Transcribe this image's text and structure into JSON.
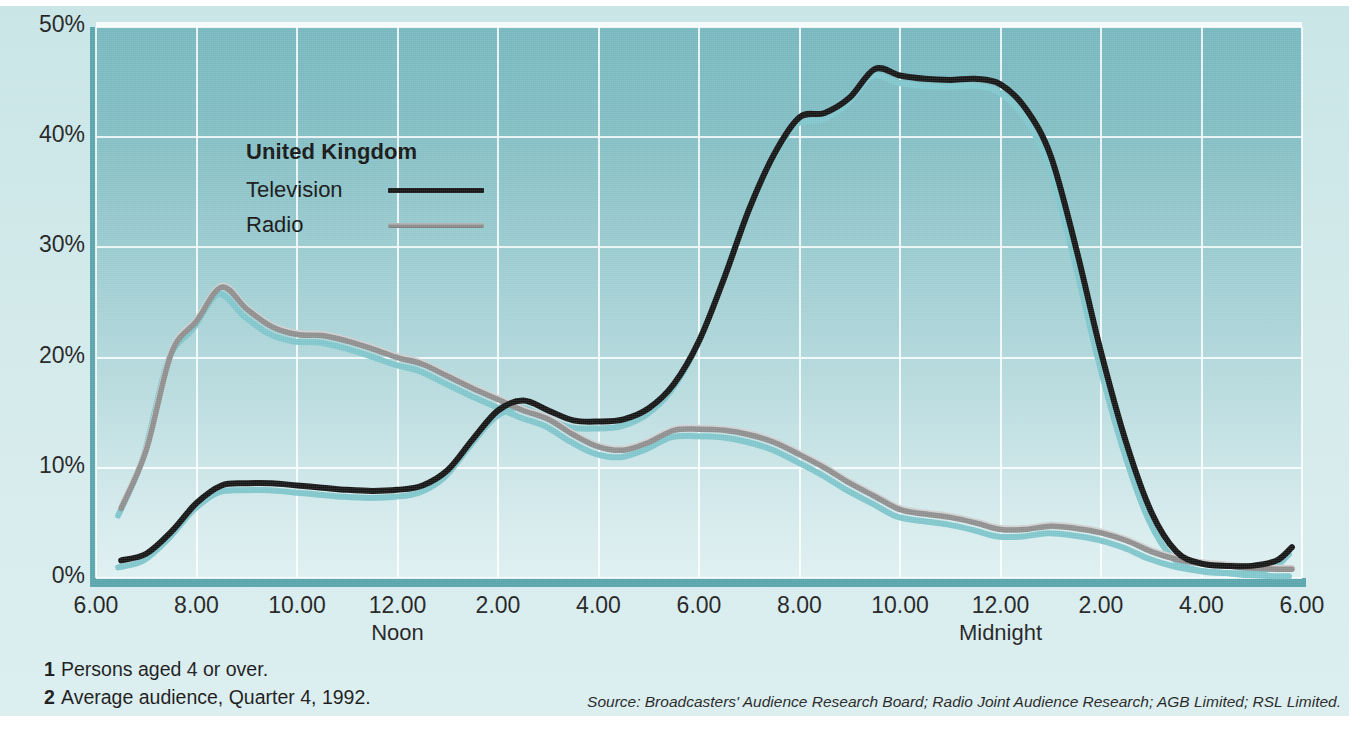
{
  "chart_data": {
    "type": "line",
    "title": "United Kingdom",
    "xlabel": "",
    "ylabel": "",
    "ylim": [
      0,
      50
    ],
    "ytick_labels": [
      "0%",
      "10%",
      "20%",
      "30%",
      "40%",
      "50%"
    ],
    "ytick_values": [
      0,
      10,
      20,
      30,
      40,
      50
    ],
    "xtick_labels": [
      "6.00",
      "8.00",
      "10.00",
      "12.00",
      "2.00",
      "4.00",
      "6.00",
      "8.00",
      "10.00",
      "12.00",
      "2.00",
      "4.00",
      "6.00"
    ],
    "xtick_sublabels": {
      "12.00_first": "Noon",
      "12.00_second": "Midnight"
    },
    "xlim_hours": [
      6,
      30
    ],
    "grid": true,
    "legend_position": "upper-left-inside",
    "series": [
      {
        "name": "Television",
        "color": "#121212",
        "x": [
          6.5,
          7,
          7.5,
          8,
          8.5,
          9,
          9.5,
          10,
          10.5,
          11,
          11.5,
          12,
          12.5,
          13,
          13.5,
          14,
          14.5,
          15,
          15.5,
          16,
          16.5,
          17,
          17.5,
          18,
          18.5,
          19,
          19.5,
          20,
          20.5,
          21,
          21.5,
          22,
          22.5,
          23,
          23.5,
          24,
          24.5,
          25,
          25.5,
          26,
          26.5,
          27,
          27.5,
          28,
          28.5,
          29,
          29.5,
          29.8
        ],
        "values": [
          1.6,
          2.2,
          4.2,
          6.8,
          8.4,
          8.6,
          8.6,
          8.4,
          8.2,
          8.0,
          7.9,
          8.0,
          8.4,
          9.8,
          12.6,
          15.2,
          16.1,
          15.2,
          14.3,
          14.2,
          14.4,
          15.4,
          17.6,
          21.5,
          27.2,
          33.5,
          38.5,
          41.8,
          42.2,
          43.6,
          46.2,
          45.6,
          45.3,
          45.2,
          45.3,
          44.8,
          42.6,
          38.3,
          30.0,
          20.5,
          12.3,
          6.0,
          2.4,
          1.3,
          1.1,
          1.1,
          1.6,
          2.8
        ]
      },
      {
        "name": "Radio",
        "color": "#8d8d8d",
        "x": [
          6.5,
          7,
          7.5,
          8,
          8.5,
          9,
          9.5,
          10,
          10.5,
          11,
          11.5,
          12,
          12.5,
          13,
          13.5,
          14,
          14.5,
          15,
          15.5,
          16,
          16.5,
          17,
          17.5,
          18,
          18.5,
          19,
          19.5,
          20,
          20.5,
          21,
          21.5,
          22,
          22.5,
          23,
          23.5,
          24,
          24.5,
          25,
          25.5,
          26,
          26.5,
          27,
          27.5,
          28,
          28.5,
          29,
          29.5,
          29.8
        ],
        "values": [
          6.3,
          11.6,
          20.4,
          23.3,
          26.4,
          24.4,
          22.8,
          22.1,
          22.0,
          21.5,
          20.8,
          20.0,
          19.4,
          18.3,
          17.2,
          16.2,
          15.2,
          14.4,
          13.0,
          11.9,
          11.6,
          12.3,
          13.4,
          13.5,
          13.4,
          13.0,
          12.3,
          11.2,
          10.0,
          8.6,
          7.4,
          6.2,
          5.8,
          5.5,
          5.0,
          4.4,
          4.4,
          4.7,
          4.5,
          4.1,
          3.4,
          2.4,
          1.7,
          1.3,
          1.1,
          0.9,
          0.8,
          0.8
        ]
      }
    ]
  },
  "axes": {
    "y_ticks": [
      {
        "label": "50%",
        "value": 50
      },
      {
        "label": "40%",
        "value": 40
      },
      {
        "label": "30%",
        "value": 30
      },
      {
        "label": "20%",
        "value": 20
      },
      {
        "label": "10%",
        "value": 10
      },
      {
        "label": "0%",
        "value": 0
      }
    ],
    "x_ticks": [
      {
        "label": "6.00",
        "sub": ""
      },
      {
        "label": "8.00",
        "sub": ""
      },
      {
        "label": "10.00",
        "sub": ""
      },
      {
        "label": "12.00",
        "sub": "Noon"
      },
      {
        "label": "2.00",
        "sub": ""
      },
      {
        "label": "4.00",
        "sub": ""
      },
      {
        "label": "6.00",
        "sub": ""
      },
      {
        "label": "8.00",
        "sub": ""
      },
      {
        "label": "10.00",
        "sub": ""
      },
      {
        "label": "12.00",
        "sub": "Midnight"
      },
      {
        "label": "2.00",
        "sub": ""
      },
      {
        "label": "4.00",
        "sub": ""
      },
      {
        "label": "6.00",
        "sub": ""
      }
    ]
  },
  "legend": {
    "title": "United Kingdom",
    "items": [
      {
        "label": "Television",
        "color": "#121212"
      },
      {
        "label": "Radio",
        "color": "#8d8d8d"
      }
    ]
  },
  "footnotes": [
    {
      "num": "1",
      "text": "Persons aged 4 or over."
    },
    {
      "num": "2",
      "text": "Average audience, Quarter 4, 1992."
    }
  ],
  "source": "Source: Broadcasters' Audience Research Board; Radio Joint Audience Research; AGB Limited; RSL Limited.",
  "colors": {
    "plot_top": "#74b6bd",
    "plot_bottom": "#dff0f1",
    "page_background": "#cfe8e9",
    "grid": "#ffffff",
    "television": "#121212",
    "radio": "#8d8d8d",
    "shadow": "#7ec5cb"
  }
}
